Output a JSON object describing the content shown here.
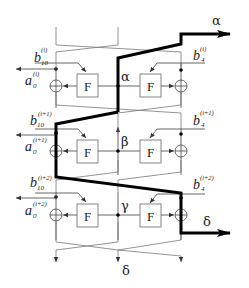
{
  "diagram": {
    "function_label": "F",
    "intermediate_labels": {
      "row1": "α",
      "row2": "β",
      "row3": "γ"
    },
    "outputs": {
      "top_right": "α",
      "bottom_right": "δ",
      "bottom_center": "δ"
    },
    "left_labels": [
      {
        "b_base": "b",
        "b_sub": "10",
        "b_sup": "(i)",
        "a_base": "a",
        "a_sub": "0",
        "a_sup": "(i)"
      },
      {
        "b_base": "b",
        "b_sub": "10",
        "b_sup": "(i+1)",
        "a_base": "a",
        "a_sub": "0",
        "a_sup": "(i+1)"
      },
      {
        "b_base": "b",
        "b_sub": "10",
        "b_sup": "(i+2)",
        "a_base": "a",
        "a_sub": "0",
        "a_sup": "(i+2)"
      }
    ],
    "right_labels": [
      {
        "b_base": "b",
        "b_sub": "4",
        "b_sup": "(i)"
      },
      {
        "b_base": "b",
        "b_sub": "4",
        "b_sup": "(i+1)"
      },
      {
        "b_base": "b",
        "b_sub": "4",
        "b_sup": "(i+2)"
      }
    ],
    "colors": {
      "trail": "#000000",
      "wires": "#555555",
      "background": "#ffffff"
    }
  }
}
